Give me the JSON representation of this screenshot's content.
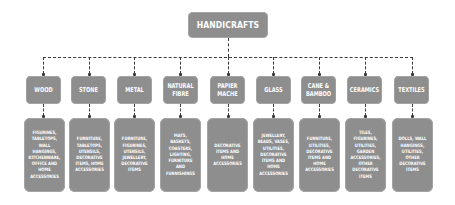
{
  "diagram": {
    "type": "tree",
    "root": {
      "label": "HANDICRAFTS"
    },
    "categories": [
      {
        "label": "WOOD",
        "description": "FIGURINES, TABLETOPS, WALL HANGINGS, KITCHENWARE, OFFICE AND HOME ACCESSORIES"
      },
      {
        "label": "STONE",
        "description": "FURNITURE, TABLETOPS, UTENSILS, DECORATIVE ITEMS, HOME ACCESSORIES"
      },
      {
        "label": "METAL",
        "description": "FURNITURE, FIGURINES, UTENSILS, JEWELLERY, DECORATIVE ITEMS"
      },
      {
        "label": "NATURAL FIBRE",
        "description": "MATS, BASKETS, COASTERS, LIGHTING, FURNITURE AND FURNISHINGS"
      },
      {
        "label": "PAPIER MACHE",
        "description": "DECORATIVE ITEMS AND HOME ACCESSORIES"
      },
      {
        "label": "GLASS",
        "description": "JEWELLERY, BEADS, VASES, UTILITIES, DECORATIVE ITEMS AND HOME ACCESSORIES"
      },
      {
        "label": "CANE & BAMBOO",
        "description": "FURNITURE, UTILITIES, DECORATIVE ITEMS AND HOME ACCESSORIES"
      },
      {
        "label": "CERAMICS",
        "description": "TILES, FIGURINES, UTILITIES, GARDEN ACCESSORIES, OTHER DECORATIVE ITEMS"
      },
      {
        "label": "TEXTILES",
        "description": "DOLLS, WALL HANGINGS, UTILITIES, OTHER DECORATIVE ITEMS"
      }
    ]
  },
  "colors": {
    "box_fill": "#8e8e8e",
    "box_text": "#ffffff",
    "connector": "#3a3a3a",
    "background": "#ffffff"
  }
}
